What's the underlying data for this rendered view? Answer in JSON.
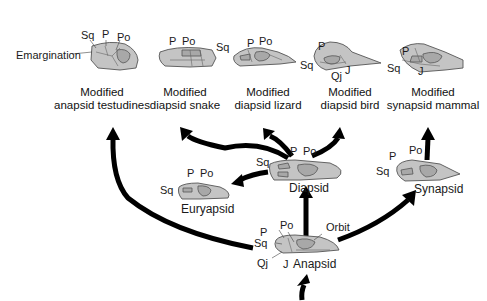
{
  "nodes": {
    "anapsid": {
      "name": "Anapsid",
      "labels": [
        "P",
        "Po",
        "Orbit",
        "Sq",
        "Qj",
        "J"
      ]
    },
    "diapsid": {
      "name": "Diapsid",
      "labels": [
        "Sq",
        "P",
        "Po"
      ]
    },
    "euryapsid": {
      "name": "Euryapsid",
      "labels": [
        "P",
        "Po",
        "Sq"
      ]
    },
    "synapsid": {
      "name": "Synapsid",
      "labels": [
        "P",
        "Po",
        "Sq"
      ]
    }
  },
  "modified": [
    {
      "line1": "Modified",
      "line2": "anapsid testudines",
      "labels": [
        "Sq",
        "P",
        "Po",
        "Emargination"
      ]
    },
    {
      "line1": "Modified",
      "line2": "diapsid snake",
      "labels": [
        "P",
        "Po"
      ]
    },
    {
      "line1": "Modified",
      "line2": "diapsid lizard",
      "labels": [
        "Sq",
        "P",
        "Po"
      ]
    },
    {
      "line1": "Modified",
      "line2": "diapsid bird",
      "labels": [
        "P",
        "Sq",
        "Qj",
        "J"
      ]
    },
    {
      "line1": "Modified",
      "line2": "synapsid mammal",
      "labels": [
        "P",
        "Sq",
        "J"
      ]
    }
  ],
  "edges": [
    {
      "from": "Anapsid",
      "to": "Diapsid"
    },
    {
      "from": "Anapsid",
      "to": "Synapsid"
    },
    {
      "from": "Anapsid",
      "to": "Modified anapsid testudines"
    },
    {
      "from": "Diapsid",
      "to": "Euryapsid"
    },
    {
      "from": "Diapsid",
      "to": "Modified diapsid snake"
    },
    {
      "from": "Diapsid",
      "to": "Modified diapsid lizard"
    },
    {
      "from": "Diapsid",
      "to": "Modified diapsid bird"
    },
    {
      "from": "Synapsid",
      "to": "Modified synapsid mammal"
    }
  ]
}
